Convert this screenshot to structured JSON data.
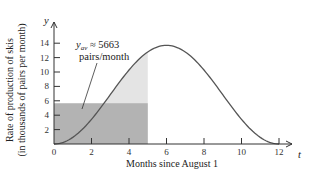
{
  "chart_data": {
    "type": "area",
    "title": "",
    "xlabel": "Months since August 1",
    "ylabel_line1": "Rate of production of skis",
    "ylabel_line2": "(in thousands of pairs per month)",
    "x_axis_var": "t",
    "y_axis_var": "y",
    "xlim": [
      0,
      12.8
    ],
    "ylim": [
      0,
      15.5
    ],
    "x_ticks": [
      0,
      2,
      4,
      6,
      8,
      10,
      12
    ],
    "x_tick_labels": [
      "0",
      "2",
      "4",
      "6",
      "8",
      "10",
      "12"
    ],
    "y_ticks": [
      2,
      4,
      6,
      8,
      10,
      12,
      14
    ],
    "y_tick_labels": [
      "2",
      "4",
      "6",
      "8",
      "10",
      "12",
      "14"
    ],
    "grid": false,
    "series": [
      {
        "name": "production rate curve",
        "x": [
          0,
          1,
          2,
          3,
          4,
          5,
          6,
          7,
          8,
          9,
          10,
          11,
          12
        ],
        "values": [
          0,
          0.92,
          3.43,
          6.85,
          10.28,
          12.78,
          13.7,
          12.78,
          10.28,
          6.85,
          3.43,
          0.92,
          0
        ]
      }
    ],
    "shaded_regions": [
      {
        "name": "area under curve",
        "x_from": 0,
        "x_to": 5,
        "color": "#e4e4e4"
      },
      {
        "name": "average value rectangle",
        "x_from": 0,
        "x_to": 5,
        "height": 5.663,
        "color": "#b3b3b3"
      }
    ],
    "annotation": {
      "line1_var": "y",
      "line1_sub": "av",
      "line1_rest": " ≈ 5663",
      "line2": "pairs/month",
      "points_to": {
        "x": 1.5,
        "y": 5.663
      }
    }
  },
  "colors": {
    "curve": "#555555",
    "axis": "#333333",
    "light_fill": "#e4e4e4",
    "dark_fill": "#b3b3b3"
  }
}
